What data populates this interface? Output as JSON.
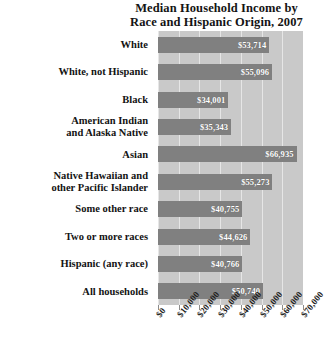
{
  "chart_data": {
    "type": "bar",
    "orientation": "horizontal",
    "title": "Median Household Income by Race and Hispanic Origin, 2007",
    "title_lines": [
      "Median Household Income by",
      "Race and Hispanic Origin, 2007"
    ],
    "xlabel": "",
    "ylabel": "",
    "xlim": [
      0,
      70000
    ],
    "grid": true,
    "legend": "none",
    "tick_values": [
      0,
      10000,
      20000,
      30000,
      40000,
      50000,
      60000,
      70000
    ],
    "tick_labels": [
      "$0",
      "$10,000",
      "$20,000",
      "$30,000",
      "$40,000",
      "$50,000",
      "$60,000",
      "$70,000"
    ],
    "categories": [
      "White",
      "White, not Hispanic",
      "Black",
      "American Indian and Alaska Native",
      "Asian",
      "Native Hawaiian and other Pacific Islander",
      "Some other race",
      "Two or more races",
      "Hispanic (any race)",
      "All households"
    ],
    "values": [
      53714,
      55096,
      34001,
      35343,
      66935,
      55273,
      40755,
      44626,
      40766,
      50740
    ],
    "value_labels": [
      "$53,714",
      "$55,096",
      "$34,001",
      "$35,343",
      "$66,935",
      "$55,273",
      "$40,755",
      "$44,626",
      "$40,766",
      "$50,740"
    ],
    "bars": [
      {
        "label_lines": [
          "White"
        ],
        "value": 53714,
        "value_label": "$53,714"
      },
      {
        "label_lines": [
          "White, not Hispanic"
        ],
        "value": 55096,
        "value_label": "$55,096"
      },
      {
        "label_lines": [
          "Black"
        ],
        "value": 34001,
        "value_label": "$34,001"
      },
      {
        "label_lines": [
          "American Indian",
          "and Alaska Native"
        ],
        "value": 35343,
        "value_label": "$35,343"
      },
      {
        "label_lines": [
          "Asian"
        ],
        "value": 66935,
        "value_label": "$66,935"
      },
      {
        "label_lines": [
          "Native Hawaiian and",
          "other Pacific Islander"
        ],
        "value": 55273,
        "value_label": "$55,273"
      },
      {
        "label_lines": [
          "Some other race"
        ],
        "value": 40755,
        "value_label": "$40,755"
      },
      {
        "label_lines": [
          "Two or more races"
        ],
        "value": 44626,
        "value_label": "$44,626"
      },
      {
        "label_lines": [
          "Hispanic (any race)"
        ],
        "value": 40766,
        "value_label": "$40,766"
      },
      {
        "label_lines": [
          "All households"
        ],
        "value": 50740,
        "value_label": "$50,740"
      }
    ],
    "colors": {
      "bar": "#808080",
      "plot_background": "#c9c9c9",
      "gridline": "#e6e6e6",
      "page_background": "#ffffff",
      "value_text": "#ffffff",
      "label_text": "#131313"
    }
  }
}
